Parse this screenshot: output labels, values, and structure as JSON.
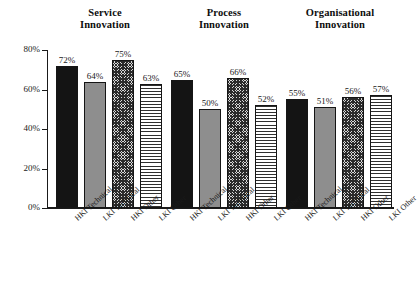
{
  "chart_data": {
    "type": "bar",
    "title": "",
    "xlabel": "",
    "ylabel": "",
    "ylim": [
      0,
      80
    ],
    "grid": false,
    "legend": "none",
    "y_tick_labels": [
      "0%",
      "20%",
      "40%",
      "60%",
      "80%"
    ],
    "y_ticks": [
      0,
      20,
      40,
      60,
      80
    ],
    "categories": [
      "HKI Technical",
      "LKI Technical",
      "HKI Other",
      "LKI Other"
    ],
    "groups": [
      {
        "title": "Service\nInnovation",
        "values": [
          72,
          64,
          75,
          63
        ],
        "value_labels": [
          "72%",
          "64%",
          "75%",
          "63%"
        ]
      },
      {
        "title": "Process\nInnovation",
        "values": [
          65,
          50,
          66,
          52
        ],
        "value_labels": [
          "65%",
          "50%",
          "66%",
          "52%"
        ]
      },
      {
        "title": "Organisational\nInnovation",
        "values": [
          55,
          51,
          56,
          57
        ],
        "value_labels": [
          "55%",
          "51%",
          "56%",
          "57%"
        ]
      }
    ],
    "series_patterns": [
      "solid-black",
      "solid-gray",
      "checker",
      "horizontal-lines"
    ],
    "colors": {
      "solid_black": "#141414",
      "solid_gray": "#8e8e8e",
      "checker": "#2b2b2b",
      "horizontal_lines": "#2f2f2f",
      "axis": "#1a1a1a",
      "background": "#ffffff"
    }
  }
}
